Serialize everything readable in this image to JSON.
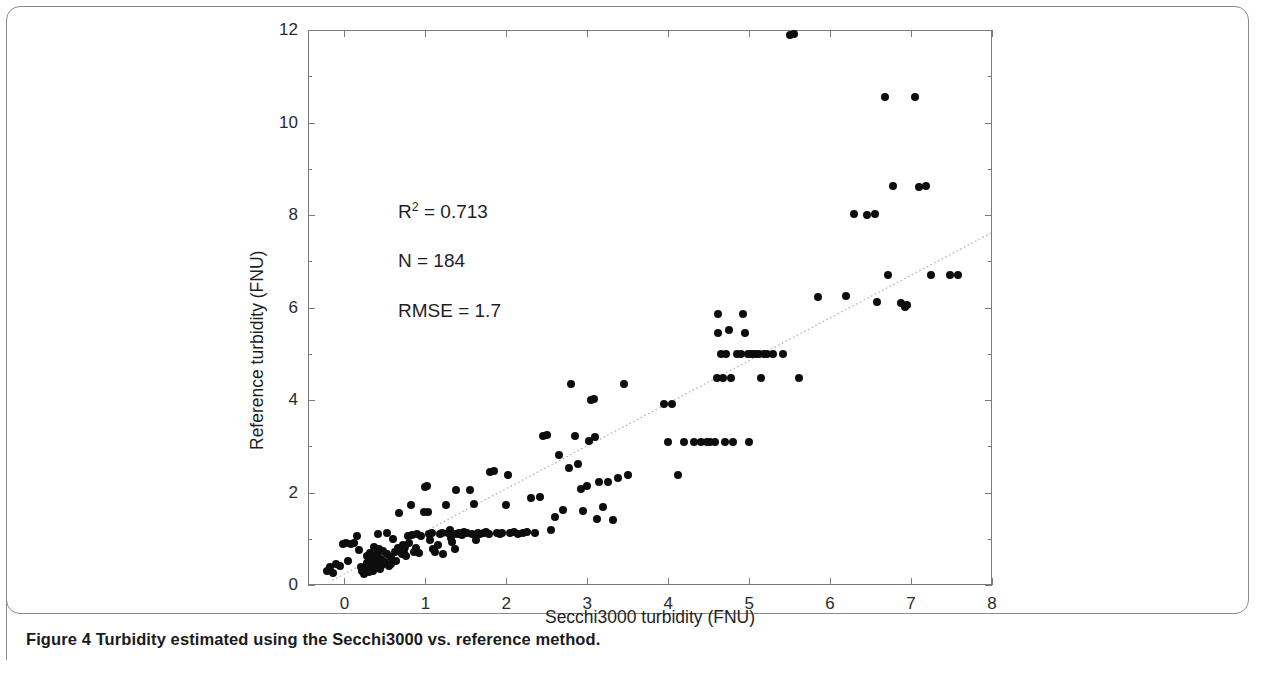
{
  "caption": "Figure 4 Turbidity estimated using the Secchi3000 vs. reference method.",
  "annotations": {
    "r2_prefix": "R",
    "r2_exp": "2",
    "r2_value": " = 0.713",
    "n_text": "N   = 184",
    "rmse_text": "RMSE = 1.7"
  },
  "chart_data": {
    "type": "scatter",
    "title": "",
    "xlabel": "Secchi3000 turbidity (FNU)",
    "ylabel": "Reference turbidity (FNU)",
    "xlim": [
      -0.45,
      8
    ],
    "ylim": [
      0,
      12
    ],
    "xticks": [
      0,
      1,
      2,
      3,
      4,
      5,
      6,
      7,
      8
    ],
    "yticks": [
      0,
      2,
      4,
      6,
      8,
      10,
      12
    ],
    "xtick_labels": [
      "0",
      "1",
      "2",
      "3",
      "4",
      "5",
      "6",
      "7",
      "8"
    ],
    "ytick_labels": [
      "0",
      "2",
      "4",
      "6",
      "8",
      "10",
      "12"
    ],
    "grid": false,
    "legend": null,
    "marker_color": "#0d0d0d",
    "trendline": {
      "style": "dotted",
      "color": "#b0b0b0",
      "x0": -0.15,
      "y0": 0.1,
      "x1": 8.0,
      "y1": 7.62
    },
    "stats": {
      "r_squared": 0.713,
      "n": 184,
      "rmse": 1.7
    },
    "points": [
      [
        -0.22,
        0.3
      ],
      [
        -0.18,
        0.38
      ],
      [
        -0.14,
        0.26
      ],
      [
        -0.1,
        0.45
      ],
      [
        -0.06,
        0.42
      ],
      [
        -0.02,
        0.88
      ],
      [
        0.02,
        0.9
      ],
      [
        0.05,
        0.52
      ],
      [
        0.08,
        0.88
      ],
      [
        0.12,
        0.9
      ],
      [
        0.15,
        1.05
      ],
      [
        0.18,
        0.75
      ],
      [
        0.2,
        0.4
      ],
      [
        0.22,
        0.3
      ],
      [
        0.24,
        0.24
      ],
      [
        0.26,
        0.34
      ],
      [
        0.28,
        0.48
      ],
      [
        0.28,
        0.62
      ],
      [
        0.3,
        0.28
      ],
      [
        0.3,
        0.44
      ],
      [
        0.32,
        0.7
      ],
      [
        0.33,
        0.58
      ],
      [
        0.34,
        0.4
      ],
      [
        0.35,
        0.3
      ],
      [
        0.36,
        0.82
      ],
      [
        0.38,
        0.52
      ],
      [
        0.38,
        0.36
      ],
      [
        0.4,
        0.68
      ],
      [
        0.41,
        0.46
      ],
      [
        0.42,
        1.1
      ],
      [
        0.43,
        0.78
      ],
      [
        0.44,
        0.34
      ],
      [
        0.45,
        0.56
      ],
      [
        0.46,
        0.44
      ],
      [
        0.48,
        0.74
      ],
      [
        0.5,
        0.5
      ],
      [
        0.52,
        1.12
      ],
      [
        0.53,
        0.66
      ],
      [
        0.55,
        0.42
      ],
      [
        0.57,
        0.6
      ],
      [
        0.58,
        0.46
      ],
      [
        0.6,
        1.0
      ],
      [
        0.62,
        0.72
      ],
      [
        0.64,
        0.52
      ],
      [
        0.66,
        0.8
      ],
      [
        0.68,
        1.55
      ],
      [
        0.7,
        0.74
      ],
      [
        0.71,
        0.66
      ],
      [
        0.72,
        0.86
      ],
      [
        0.73,
        0.78
      ],
      [
        0.74,
        0.7
      ],
      [
        0.75,
        0.82
      ],
      [
        0.76,
        0.62
      ],
      [
        0.78,
        1.05
      ],
      [
        0.8,
        0.9
      ],
      [
        0.82,
        1.72
      ],
      [
        0.84,
        1.08
      ],
      [
        0.86,
        0.72
      ],
      [
        0.88,
        0.8
      ],
      [
        0.9,
        1.1
      ],
      [
        0.92,
        0.7
      ],
      [
        0.95,
        1.05
      ],
      [
        0.98,
        1.58
      ],
      [
        1.0,
        2.12
      ],
      [
        1.02,
        2.15
      ],
      [
        1.03,
        1.58
      ],
      [
        1.05,
        1.1
      ],
      [
        1.06,
        0.98
      ],
      [
        1.08,
        1.12
      ],
      [
        1.1,
        0.78
      ],
      [
        1.12,
        0.72
      ],
      [
        1.15,
        0.86
      ],
      [
        1.18,
        1.1
      ],
      [
        1.2,
        1.12
      ],
      [
        1.22,
        0.68
      ],
      [
        1.25,
        1.72
      ],
      [
        1.28,
        1.12
      ],
      [
        1.3,
        1.18
      ],
      [
        1.32,
        1.02
      ],
      [
        1.33,
        0.92
      ],
      [
        1.35,
        1.1
      ],
      [
        1.36,
        0.78
      ],
      [
        1.38,
        2.05
      ],
      [
        1.4,
        1.1
      ],
      [
        1.42,
        1.12
      ],
      [
        1.45,
        1.08
      ],
      [
        1.48,
        1.14
      ],
      [
        1.52,
        1.12
      ],
      [
        1.55,
        2.05
      ],
      [
        1.58,
        1.1
      ],
      [
        1.6,
        1.75
      ],
      [
        1.62,
        0.98
      ],
      [
        1.65,
        1.12
      ],
      [
        1.68,
        1.1
      ],
      [
        1.72,
        1.12
      ],
      [
        1.75,
        1.14
      ],
      [
        1.78,
        1.1
      ],
      [
        1.8,
        2.45
      ],
      [
        1.85,
        2.46
      ],
      [
        1.88,
        1.12
      ],
      [
        1.92,
        1.1
      ],
      [
        1.95,
        1.12
      ],
      [
        2.0,
        1.72
      ],
      [
        2.02,
        2.38
      ],
      [
        2.05,
        1.12
      ],
      [
        2.1,
        1.14
      ],
      [
        2.15,
        1.1
      ],
      [
        2.2,
        1.12
      ],
      [
        2.25,
        1.14
      ],
      [
        2.3,
        1.88
      ],
      [
        2.35,
        1.12
      ],
      [
        2.42,
        1.9
      ],
      [
        2.45,
        3.22
      ],
      [
        2.5,
        3.25
      ],
      [
        2.55,
        1.18
      ],
      [
        2.6,
        1.48
      ],
      [
        2.65,
        2.82
      ],
      [
        2.7,
        1.62
      ],
      [
        2.78,
        2.52
      ],
      [
        2.8,
        4.35
      ],
      [
        2.85,
        3.22
      ],
      [
        2.88,
        2.62
      ],
      [
        2.92,
        2.08
      ],
      [
        2.95,
        1.6
      ],
      [
        3.0,
        2.15
      ],
      [
        3.02,
        3.12
      ],
      [
        3.05,
        4.0
      ],
      [
        3.08,
        4.02
      ],
      [
        3.1,
        3.2
      ],
      [
        3.12,
        1.42
      ],
      [
        3.15,
        2.22
      ],
      [
        3.2,
        1.68
      ],
      [
        3.25,
        2.22
      ],
      [
        3.32,
        1.4
      ],
      [
        3.38,
        2.32
      ],
      [
        3.45,
        4.35
      ],
      [
        3.5,
        2.38
      ],
      [
        3.95,
        3.92
      ],
      [
        4.0,
        3.1
      ],
      [
        4.05,
        3.92
      ],
      [
        4.12,
        2.38
      ],
      [
        4.2,
        3.1
      ],
      [
        4.32,
        3.1
      ],
      [
        4.4,
        3.1
      ],
      [
        4.48,
        3.1
      ],
      [
        4.52,
        3.1
      ],
      [
        4.58,
        3.1
      ],
      [
        4.6,
        4.48
      ],
      [
        4.62,
        5.85
      ],
      [
        4.62,
        5.45
      ],
      [
        4.65,
        5.0
      ],
      [
        4.68,
        4.48
      ],
      [
        4.7,
        3.1
      ],
      [
        4.72,
        5.0
      ],
      [
        4.75,
        5.52
      ],
      [
        4.78,
        4.48
      ],
      [
        4.8,
        3.1
      ],
      [
        4.85,
        5.0
      ],
      [
        4.9,
        5.0
      ],
      [
        4.92,
        5.85
      ],
      [
        4.95,
        5.45
      ],
      [
        4.98,
        5.0
      ],
      [
        5.0,
        3.1
      ],
      [
        5.02,
        5.0
      ],
      [
        5.05,
        5.0
      ],
      [
        5.08,
        5.0
      ],
      [
        5.12,
        5.0
      ],
      [
        5.15,
        4.48
      ],
      [
        5.18,
        5.0
      ],
      [
        5.22,
        5.0
      ],
      [
        5.3,
        5.0
      ],
      [
        5.42,
        5.0
      ],
      [
        5.5,
        11.9
      ],
      [
        5.55,
        11.92
      ],
      [
        5.62,
        4.48
      ],
      [
        5.85,
        6.22
      ],
      [
        6.2,
        6.25
      ],
      [
        6.3,
        8.02
      ],
      [
        6.45,
        8.0
      ],
      [
        6.55,
        8.02
      ],
      [
        6.58,
        6.12
      ],
      [
        6.68,
        10.55
      ],
      [
        6.72,
        6.7
      ],
      [
        6.78,
        8.62
      ],
      [
        6.88,
        6.1
      ],
      [
        6.92,
        6.02
      ],
      [
        6.95,
        6.05
      ],
      [
        7.05,
        10.55
      ],
      [
        7.1,
        8.6
      ],
      [
        7.18,
        8.62
      ],
      [
        7.25,
        6.7
      ],
      [
        7.48,
        6.7
      ],
      [
        7.58,
        6.7
      ]
    ]
  }
}
